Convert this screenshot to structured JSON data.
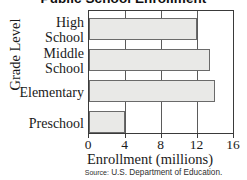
{
  "chart_data": {
    "type": "bar",
    "orientation": "horizontal",
    "title": "Public School Enrollment",
    "xlabel": "Enrollment (millions)",
    "ylabel": "Grade Level",
    "categories": [
      "High School",
      "Middle School",
      "Elementary",
      "Preschool"
    ],
    "category_lines": [
      [
        "High",
        "School"
      ],
      [
        "Middle",
        "School"
      ],
      [
        "Elementary"
      ],
      [
        "Preschool"
      ]
    ],
    "values": [
      12.0,
      13.4,
      14.0,
      4.0
    ],
    "xlim": [
      0,
      16
    ],
    "xticks": [
      0,
      4,
      8,
      12,
      16
    ],
    "xtick_labels": [
      "0",
      "4",
      "8",
      "12",
      "16"
    ],
    "grid": true,
    "grid_axis": "x",
    "legend": null,
    "bar_fill_color": "#e9e9e7",
    "bar_border_color": "#6a6a6a",
    "axis_color": "#3a3a3a"
  },
  "source": {
    "prefix": "Source:",
    "text": "U.S. Department of Education."
  }
}
